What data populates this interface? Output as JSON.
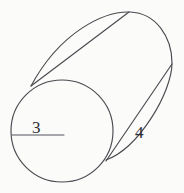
{
  "figure": {
    "shape_name": "cylinder",
    "background_color": "#fbfbfa",
    "stroke_color": "#4a4a50",
    "label_color": "#2e2e33",
    "width": 184,
    "height": 193
  },
  "labels": {
    "radius": "3",
    "slant": "4"
  },
  "geometry": {
    "near_circle": {
      "name": "near-face-circle",
      "cx": 62,
      "cy": 131,
      "r": 51
    },
    "radius_line": {
      "name": "radius-line",
      "x1": 12,
      "y1": 135,
      "x2": 64,
      "y2": 135
    },
    "far_arc": {
      "name": "far-face-arc",
      "path": "M 31 86 C 60 32 104 11 130 12 C 156 13 172 37 172 63 C 172 92 139 148 106 160"
    },
    "top_tangent": {
      "name": "top-tangent-line",
      "x1": 31,
      "y1": 86,
      "x2": 129,
      "y2": 12
    },
    "bottom_tangent": {
      "name": "bottom-tangent-line",
      "x1": 106,
      "y1": 161,
      "x2": 172,
      "y2": 64
    }
  },
  "chart_data": {
    "type": "diagram",
    "annotations": [
      {
        "text": "3",
        "meaning": "radius of circular face",
        "x": 38,
        "y": 128
      },
      {
        "text": "4",
        "meaning": "slant / height along side",
        "x": 141,
        "y": 133
      }
    ]
  }
}
